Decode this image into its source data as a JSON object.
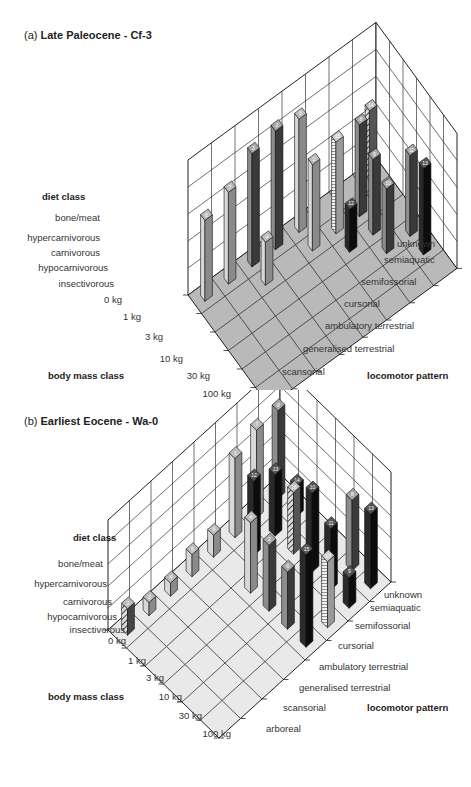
{
  "panels": [
    {
      "id": "a",
      "prefix": "(a)",
      "title": "Late Paleocene - Cf-3",
      "floor_color": "#b9b9b9",
      "diet_axis": {
        "title": "diet class",
        "labels": [
          "bone/meat",
          "hypercarnivorous",
          "carnivorous",
          "hypocarnivorous",
          "insectivorous"
        ]
      },
      "mass_axis": {
        "title": "body mass class",
        "labels": [
          "0 kg",
          "1 kg",
          "3 kg",
          "10 kg",
          "30 kg",
          "100 kg"
        ]
      },
      "locomotor_axis": {
        "title": "locomotor pattern",
        "labels": [
          "unknown",
          "semiaquatic",
          "semifossorial",
          "cursorial",
          "ambulatory terrestrial",
          "generalised terrestrial",
          "scansorial",
          "arboreal"
        ]
      }
    },
    {
      "id": "b",
      "prefix": "(b)",
      "title": "Earliest Eocene - Wa-0",
      "floor_color": "#e9e9e9",
      "diet_axis": {
        "title": "diet class",
        "labels": [
          "bone/meat",
          "hypercarnivorous",
          "carnivorous",
          "hypocarnivorous",
          "insectivorous"
        ]
      },
      "mass_axis": {
        "title": "body mass class",
        "labels": [
          "0 kg",
          "1 kg",
          "3 kg",
          "10 kg",
          "30 kg",
          "100 kg"
        ]
      },
      "locomotor_axis": {
        "title": "locomotor pattern",
        "labels": [
          "unknown",
          "semiaquatic",
          "semifossorial",
          "cursorial",
          "ambulatory terrestrial",
          "generalised terrestrial",
          "scansorial",
          "arboreal"
        ]
      }
    }
  ],
  "chart_data": [
    {
      "type": "bar3d",
      "title": "(a) Late Paleocene - Cf-3",
      "xlabel": "body mass class",
      "ylabel": "locomotor pattern",
      "zlabel": "diet class",
      "x_ticks": [
        "0 kg",
        "1 kg",
        "3 kg",
        "10 kg",
        "30 kg",
        "100 kg"
      ],
      "y_ticks": [
        "arboreal",
        "scansorial",
        "generalised terrestrial",
        "ambulatory terrestrial",
        "cursorial",
        "semifossorial",
        "semiaquatic",
        "unknown"
      ],
      "z_ticks": [
        "insectivorous",
        "hypocarnivorous",
        "carnivorous",
        "hypercarnivorous",
        "bone/meat"
      ],
      "bars": [
        {
          "label": "6",
          "x": 0,
          "y": 0,
          "z": 3.0,
          "style": "light"
        },
        {
          "label": "7",
          "x": 0,
          "y": 1,
          "z": 3.4,
          "style": "light"
        },
        {
          "label": "3",
          "x": 0,
          "y": 2,
          "z": 4.2,
          "style": "dark"
        },
        {
          "label": "2",
          "x": 0,
          "y": 3,
          "z": 4.4,
          "style": "dark"
        },
        {
          "label": "5",
          "x": 0,
          "y": 4,
          "z": 4.2,
          "style": "light"
        },
        {
          "label": "4",
          "x": 1,
          "y": 2,
          "z": 1.6,
          "style": "light"
        },
        {
          "label": "1",
          "x": 1,
          "y": 4,
          "z": 3.2,
          "style": "light"
        },
        {
          "label": "15",
          "x": 1,
          "y": 5,
          "z": 3.4,
          "style": "hatched"
        },
        {
          "label": "8",
          "x": 1,
          "y": 6,
          "z": 3.4,
          "style": "dark"
        },
        {
          "label": "12",
          "x": 2,
          "y": 5,
          "z": 1.6,
          "style": "black"
        },
        {
          "label": "9",
          "x": 2,
          "y": 6,
          "z": 2.8,
          "style": "dark"
        },
        {
          "label": "10",
          "x": 3,
          "y": 6,
          "z": 2.4,
          "style": "dark"
        },
        {
          "label": "11",
          "x": 3,
          "y": 7,
          "z": 3.0,
          "style": "dark"
        },
        {
          "label": "13",
          "x": 4,
          "y": 7,
          "z": 3.2,
          "style": "black"
        },
        {
          "label": "14",
          "x": 0,
          "y": 7,
          "z": 2.6,
          "style": "striped"
        }
      ]
    },
    {
      "type": "bar3d",
      "title": "(b) Earliest Eocene - Wa-0",
      "xlabel": "body mass class",
      "ylabel": "locomotor pattern",
      "zlabel": "diet class",
      "x_ticks": [
        "0 kg",
        "1 kg",
        "3 kg",
        "10 kg",
        "30 kg",
        "100 kg"
      ],
      "y_ticks": [
        "arboreal",
        "scansorial",
        "generalised terrestrial",
        "ambulatory terrestrial",
        "cursorial",
        "semifossorial",
        "semiaquatic",
        "unknown"
      ],
      "z_ticks": [
        "insectivorous",
        "hypocarnivorous",
        "carnivorous",
        "hypercarnivorous",
        "bone/meat"
      ],
      "bars": [
        {
          "label": "2",
          "x": 0,
          "y": 0,
          "z": 1.2,
          "style": "hatched2"
        },
        {
          "label": "3",
          "x": 0,
          "y": 1,
          "z": 0.6,
          "style": "light"
        },
        {
          "label": "4",
          "x": 0,
          "y": 2,
          "z": 0.6,
          "style": "light"
        },
        {
          "label": "5",
          "x": 0,
          "y": 3,
          "z": 1.0,
          "style": "light"
        },
        {
          "label": "6",
          "x": 0,
          "y": 4,
          "z": 1.0,
          "style": "light"
        },
        {
          "label": "1",
          "x": 0,
          "y": 5,
          "z": 3.6,
          "style": "light"
        },
        {
          "label": "7",
          "x": 0,
          "y": 6,
          "z": 4.0,
          "style": "light"
        },
        {
          "label": "8",
          "x": 0,
          "y": 7,
          "z": 4.0,
          "style": "dark"
        },
        {
          "label": "12",
          "x": 1,
          "y": 5,
          "z": 3.4,
          "style": "black"
        },
        {
          "label": "13",
          "x": 1,
          "y": 6,
          "z": 2.8,
          "style": "black"
        },
        {
          "label": "14",
          "x": 1,
          "y": 7,
          "z": 1.4,
          "style": "black"
        },
        {
          "label": "4",
          "x": 2,
          "y": 4,
          "z": 3.2,
          "style": "light"
        },
        {
          "label": "16",
          "x": 2,
          "y": 6,
          "z": 2.8,
          "style": "striped"
        },
        {
          "label": "2",
          "x": 3,
          "y": 4,
          "z": 3.0,
          "style": "dark"
        },
        {
          "label": "10",
          "x": 3,
          "y": 6,
          "z": 3.6,
          "style": "black"
        },
        {
          "label": "11",
          "x": 4,
          "y": 6,
          "z": 2.8,
          "style": "black"
        },
        {
          "label": "6",
          "x": 4,
          "y": 4,
          "z": 2.6,
          "style": "dark"
        },
        {
          "label": "8",
          "x": 4,
          "y": 7,
          "z": 3.2,
          "style": "dark"
        },
        {
          "label": "13",
          "x": 5,
          "y": 7,
          "z": 3.4,
          "style": "black"
        },
        {
          "label": "9",
          "x": 5,
          "y": 6,
          "z": 1.4,
          "style": "black"
        },
        {
          "label": "17",
          "x": 5,
          "y": 5,
          "z": 3.0,
          "style": "hatched"
        },
        {
          "label": "15",
          "x": 5,
          "y": 4,
          "z": 4.2,
          "style": "black"
        }
      ]
    }
  ]
}
